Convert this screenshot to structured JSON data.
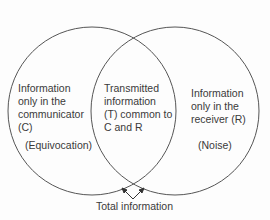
{
  "diagram": {
    "type": "venn",
    "stroke_color": "#555555",
    "text_color": "#3a3a3a",
    "circles": [
      {
        "id": "communicator",
        "cx": 92,
        "cy": 111,
        "r": 84
      },
      {
        "id": "receiver",
        "cx": 175,
        "cy": 111,
        "r": 84
      }
    ],
    "regions": {
      "left": {
        "lines": [
          "Information",
          "only in the",
          "communicator",
          "(C)"
        ],
        "note": "(Equivocation)"
      },
      "center": {
        "lines": [
          "Transmitted",
          "information",
          "(T) common to",
          "C and R"
        ]
      },
      "right": {
        "lines": [
          "Information",
          "only in the",
          "receiver (R)"
        ],
        "note": "(Noise)"
      }
    },
    "bottom_label": "Total information"
  }
}
